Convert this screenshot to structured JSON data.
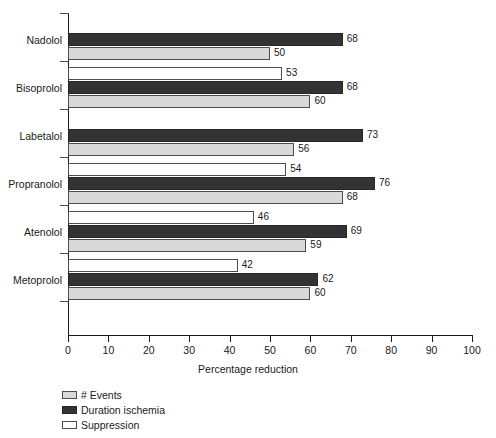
{
  "chart_data": {
    "type": "bar",
    "orientation": "horizontal",
    "title": "",
    "xlabel": "Percentage reduction",
    "ylabel": "",
    "xlim": [
      0,
      100
    ],
    "xticks": [
      0,
      10,
      20,
      30,
      40,
      50,
      60,
      70,
      80,
      90,
      100
    ],
    "grid": false,
    "legend_position": "bottom-left",
    "categories": [
      "Nadolol",
      "Bisoprolol",
      "Labetalol",
      "Propranolol",
      "Atenolol",
      "Metoprolol"
    ],
    "series": [
      {
        "name": "Suppression",
        "color": "#ffffff",
        "values": [
          null,
          53,
          null,
          54,
          46,
          42
        ]
      },
      {
        "name": "Duration ischemia",
        "color": "#333333",
        "values": [
          68,
          68,
          73,
          76,
          69,
          62
        ]
      },
      {
        "name": "# Events",
        "color": "#d9d9d9",
        "values": [
          50,
          60,
          56,
          68,
          59,
          60
        ]
      }
    ],
    "groups": [
      {
        "category": "Nadolol",
        "bars": [
          {
            "series": "Suppression",
            "value": null,
            "label": ""
          },
          {
            "series": "Duration ischemia",
            "value": 68,
            "label": "68"
          },
          {
            "series": "# Events",
            "value": 50,
            "label": "50"
          }
        ]
      },
      {
        "category": "Bisoprolol",
        "bars": [
          {
            "series": "Suppression",
            "value": 53,
            "label": "53"
          },
          {
            "series": "Duration ischemia",
            "value": 68,
            "label": "68"
          },
          {
            "series": "# Events",
            "value": 60,
            "label": "60"
          }
        ]
      },
      {
        "category": "Labetalol",
        "bars": [
          {
            "series": "Suppression",
            "value": null,
            "label": ""
          },
          {
            "series": "Duration ischemia",
            "value": 73,
            "label": "73"
          },
          {
            "series": "# Events",
            "value": 56,
            "label": "56"
          }
        ]
      },
      {
        "category": "Propranolol",
        "bars": [
          {
            "series": "Suppression",
            "value": 54,
            "label": "54"
          },
          {
            "series": "Duration ischemia",
            "value": 76,
            "label": "76"
          },
          {
            "series": "# Events",
            "value": 68,
            "label": "68"
          }
        ]
      },
      {
        "category": "Atenolol",
        "bars": [
          {
            "series": "Suppression",
            "value": 46,
            "label": "46"
          },
          {
            "series": "Duration ischemia",
            "value": 69,
            "label": "69"
          },
          {
            "series": "# Events",
            "value": 59,
            "label": "59"
          }
        ]
      },
      {
        "category": "Metoprolol",
        "bars": [
          {
            "series": "Suppression",
            "value": 42,
            "label": "42"
          },
          {
            "series": "Duration ischemia",
            "value": 62,
            "label": "62"
          },
          {
            "series": "# Events",
            "value": 60,
            "label": "60"
          }
        ]
      }
    ]
  },
  "axis": {
    "x_title": "Percentage reduction",
    "x_tick_labels": [
      "0",
      "10",
      "20",
      "30",
      "40",
      "50",
      "60",
      "70",
      "80",
      "90",
      "100"
    ],
    "y_tick_labels": [
      "Nadolol",
      "Bisoprolol",
      "Labetalol",
      "Propranolol",
      "Atenolol",
      "Metoprolol"
    ]
  },
  "legend": {
    "items": [
      {
        "label": "# Events",
        "swatch": "events",
        "color": "#d9d9d9"
      },
      {
        "label": "Duration ischemia",
        "swatch": "duration",
        "color": "#333333"
      },
      {
        "label": "Suppression",
        "swatch": "suppression",
        "color": "#ffffff"
      }
    ]
  },
  "colors": {
    "events": "#d9d9d9",
    "duration_ischemia": "#333333",
    "suppression": "#ffffff",
    "axis": "#1a1a1a",
    "background": "#ffffff"
  }
}
